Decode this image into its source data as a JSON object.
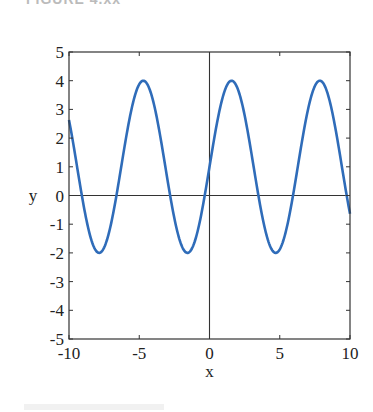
{
  "header": {
    "text": "FIGURE 4.xx"
  },
  "chart_data": {
    "type": "line",
    "title": "",
    "xlabel": "x",
    "ylabel": "y",
    "xlim": [
      -10,
      10
    ],
    "ylim": [
      -5,
      5
    ],
    "xticks": [
      -10,
      -5,
      0,
      5,
      10
    ],
    "yticks": [
      -5,
      -4,
      -3,
      -2,
      -1,
      0,
      1,
      2,
      3,
      4,
      5
    ],
    "xtick_labels": [
      "-10",
      "-5",
      "0",
      "5",
      "10"
    ],
    "ytick_labels": [
      "-5",
      "-4",
      "-3",
      "-2",
      "-1",
      "0",
      "1",
      "2",
      "3",
      "4",
      "5"
    ],
    "grid": false,
    "box": true,
    "zero_axes": true,
    "legend": null,
    "series": [
      {
        "name": "y = 1 + 3 sin(x)",
        "color": "#2f6cb9",
        "function": "1 + 3*sin(x)",
        "x": [
          -10,
          -9,
          -8,
          -7.854,
          -7,
          -6,
          -5,
          -4.712,
          -4,
          -3,
          -2,
          -1.571,
          -1,
          0,
          1,
          1.571,
          2,
          3,
          4,
          4.712,
          5,
          6,
          7,
          7.854,
          8,
          9,
          10
        ],
        "y": [
          2.63,
          -0.24,
          -1.97,
          -2.0,
          -0.97,
          1.84,
          3.88,
          4.0,
          3.27,
          0.58,
          -1.73,
          -2.0,
          -1.52,
          1.0,
          3.52,
          4.0,
          3.73,
          1.42,
          -1.27,
          -2.0,
          -1.88,
          0.16,
          2.97,
          4.0,
          3.97,
          2.24,
          -0.63
        ]
      }
    ]
  }
}
